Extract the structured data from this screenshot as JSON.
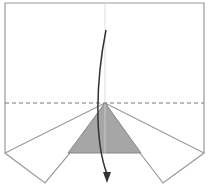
{
  "diagram": {
    "type": "origami-fold-step",
    "paper_color": "#ffffff",
    "line_color": "#888888",
    "shaded_color": "#a6a6a6",
    "arrow_color": "#333333",
    "instruction": "valley fold down along dashed line",
    "elements": [
      {
        "name": "paper-outline"
      },
      {
        "name": "center-crease"
      },
      {
        "name": "valley-fold-line",
        "style": "dashed"
      },
      {
        "name": "left-flap"
      },
      {
        "name": "right-flap"
      },
      {
        "name": "shaded-triangle"
      },
      {
        "name": "fold-arrow",
        "direction": "down"
      }
    ]
  }
}
